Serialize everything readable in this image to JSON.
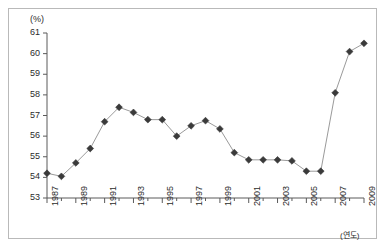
{
  "chart_data": {
    "type": "line",
    "title": "",
    "subtitle": "",
    "xlabel": "(연도)",
    "ylabel": "(%)",
    "unit_label": "(%)",
    "x": [
      1987,
      1988,
      1989,
      1990,
      1991,
      1992,
      1993,
      1994,
      1995,
      1996,
      1997,
      1998,
      1999,
      2000,
      2001,
      2002,
      2003,
      2004,
      2005,
      2006,
      2007,
      2008,
      2009
    ],
    "values": [
      54.2,
      54.05,
      54.7,
      55.4,
      56.7,
      57.4,
      57.15,
      56.8,
      56.8,
      56.0,
      56.5,
      56.75,
      56.35,
      55.2,
      54.85,
      54.85,
      54.85,
      54.8,
      54.3,
      54.3,
      58.1,
      60.1,
      60.5
    ],
    "series": [
      {
        "name": "비율",
        "values": [
          54.2,
          54.05,
          54.7,
          55.4,
          56.7,
          57.4,
          57.15,
          56.8,
          56.8,
          56.0,
          56.5,
          56.75,
          56.35,
          55.2,
          54.85,
          54.85,
          54.85,
          54.8,
          54.3,
          54.3,
          58.1,
          60.1,
          60.5
        ]
      }
    ],
    "ylim": [
      53,
      61
    ],
    "xlim": [
      1987,
      2009
    ],
    "ytick_values": [
      53,
      54,
      55,
      56,
      57,
      58,
      59,
      60,
      61
    ],
    "ytick_labels": [
      "53",
      "54",
      "55",
      "56",
      "57",
      "58",
      "59",
      "60",
      "61"
    ],
    "xtick_values": [
      1987,
      1989,
      1991,
      1993,
      1995,
      1997,
      1999,
      2001,
      2003,
      2005,
      2007,
      2009
    ],
    "xtick_labels": [
      "1987",
      "1989",
      "1991",
      "1993",
      "1995",
      "1997",
      "1999",
      "2001",
      "2003",
      "2005",
      "2007",
      "2009"
    ],
    "xtick_minor_values": [
      1988,
      1990,
      1992,
      1994,
      1996,
      1998,
      2000,
      2002,
      2004,
      2006,
      2008
    ],
    "grid": false,
    "legend": "none",
    "marker": "diamond",
    "line_color": "#9a9a9a",
    "marker_color": "#3a3a3a",
    "axis_color": "#5a5a5a",
    "border_color": "#b9b9b9",
    "background": "#ffffff"
  }
}
